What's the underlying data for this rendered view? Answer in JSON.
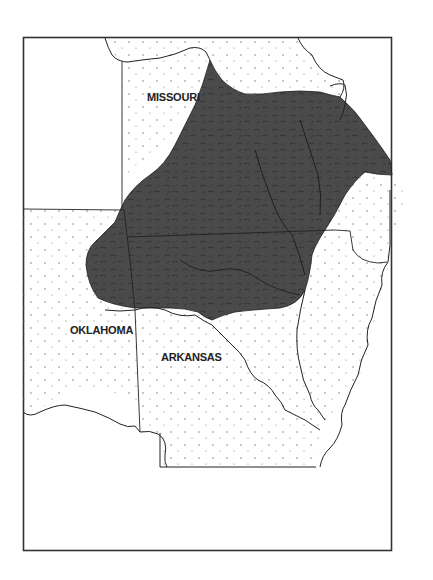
{
  "map": {
    "type": "regional-outline-map",
    "frame": {
      "x": 23,
      "y": 37,
      "width": 369,
      "height": 514
    },
    "colors": {
      "background": "#ffffff",
      "frame_stroke": "#333333",
      "boundary_stroke": "#222222",
      "highlight_region_fill": "#4a4a4a",
      "dot_pattern": "#666666"
    },
    "labels": [
      {
        "id": "missouri",
        "text": "MISSOURI",
        "x": 145,
        "y": 100
      },
      {
        "id": "oklahoma",
        "text": "OKLAHOMA",
        "x": 70,
        "y": 333
      },
      {
        "id": "arkansas",
        "text": "ARKANSAS",
        "x": 161,
        "y": 360
      }
    ],
    "highlighted_region": {
      "description": "Dark shaded upland plateau region spanning southern Missouri, northern Arkansas and northeastern Oklahoma",
      "fill": "#4a4a4a"
    },
    "dotted_areas": [
      "Missouri north/west plains",
      "Oklahoma",
      "Arkansas lowlands",
      "Mississippi lowlands east"
    ]
  }
}
